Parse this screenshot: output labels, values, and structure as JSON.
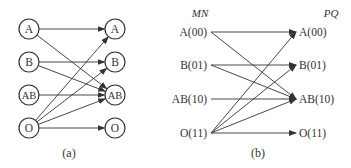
{
  "panel_a": {
    "caption": "(a)",
    "left_nodes": [
      {
        "label": "A",
        "x": 29,
        "y": 29
      },
      {
        "label": "B",
        "x": 29,
        "y": 62
      },
      {
        "label": "AB",
        "x": 29,
        "y": 95
      },
      {
        "label": "O",
        "x": 29,
        "y": 128
      }
    ],
    "right_nodes": [
      {
        "label": "A",
        "x": 115,
        "y": 29
      },
      {
        "label": "B",
        "x": 115,
        "y": 62
      },
      {
        "label": "AB",
        "x": 115,
        "y": 95
      },
      {
        "label": "O",
        "x": 115,
        "y": 128
      }
    ],
    "edges": [
      {
        "from": "A",
        "to": "A"
      },
      {
        "from": "A",
        "to": "AB"
      },
      {
        "from": "B",
        "to": "B"
      },
      {
        "from": "B",
        "to": "AB"
      },
      {
        "from": "AB",
        "to": "AB"
      },
      {
        "from": "O",
        "to": "A"
      },
      {
        "from": "O",
        "to": "B"
      },
      {
        "from": "O",
        "to": "AB"
      },
      {
        "from": "O",
        "to": "O"
      }
    ]
  },
  "panel_b": {
    "caption": "(b)",
    "left_header": "MN",
    "right_header": "PQ",
    "left_nodes": [
      {
        "label": "A(00)",
        "y": 32
      },
      {
        "label": "B(01)",
        "y": 65
      },
      {
        "label": "AB(10)",
        "y": 99
      },
      {
        "label": "O(11)",
        "y": 133
      }
    ],
    "right_nodes": [
      {
        "label": "A(00)",
        "y": 32
      },
      {
        "label": "B(01)",
        "y": 65
      },
      {
        "label": "AB(10)",
        "y": 99
      },
      {
        "label": "O(11)",
        "y": 133
      }
    ],
    "edges": [
      {
        "from": "A(00)",
        "to": "A(00)"
      },
      {
        "from": "A(00)",
        "to": "AB(10)"
      },
      {
        "from": "B(01)",
        "to": "B(01)"
      },
      {
        "from": "B(01)",
        "to": "AB(10)"
      },
      {
        "from": "AB(10)",
        "to": "AB(10)"
      },
      {
        "from": "O(11)",
        "to": "A(00)"
      },
      {
        "from": "O(11)",
        "to": "B(01)"
      },
      {
        "from": "O(11)",
        "to": "AB(10)"
      },
      {
        "from": "O(11)",
        "to": "O(11)"
      }
    ]
  },
  "colors": {
    "stroke": "#333333",
    "background": "#ffffff"
  }
}
